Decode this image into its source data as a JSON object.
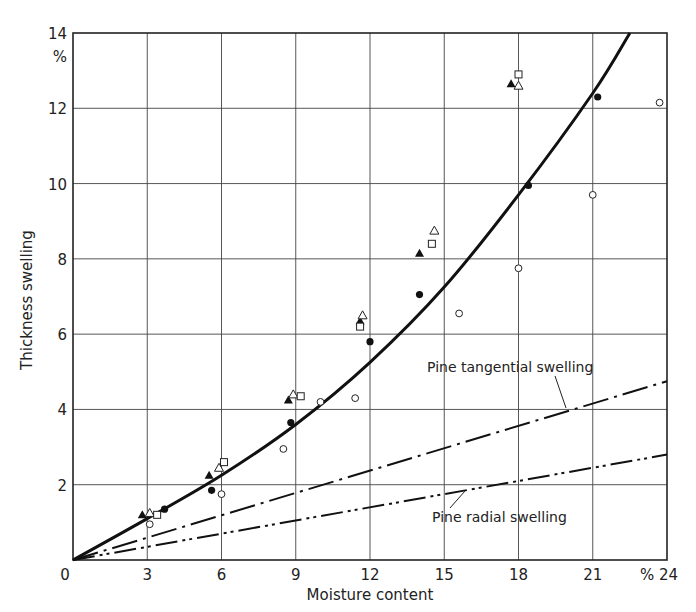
{
  "chart_data": {
    "type": "scatter",
    "title": "",
    "xlabel": "Moisture content",
    "ylabel": "Thickness swelling",
    "x_unit": "%",
    "y_unit": "%",
    "xlim": [
      0,
      24
    ],
    "ylim": [
      0,
      14
    ],
    "x_ticks": [
      "0",
      "3",
      "6",
      "9",
      "12",
      "15",
      "18",
      "21",
      "% 24"
    ],
    "y_ticks": [
      "2",
      "4",
      "6",
      "8",
      "10",
      "12",
      "14"
    ],
    "grid": true,
    "series": [
      {
        "name": "filled circles",
        "marker": "filled-circle",
        "points": [
          [
            3.7,
            1.35
          ],
          [
            5.6,
            1.85
          ],
          [
            8.8,
            3.65
          ],
          [
            12.0,
            5.8
          ],
          [
            14.0,
            7.05
          ],
          [
            18.4,
            9.95
          ],
          [
            21.2,
            12.3
          ]
        ]
      },
      {
        "name": "open circles",
        "marker": "open-circle",
        "points": [
          [
            3.1,
            0.95
          ],
          [
            6.0,
            1.75
          ],
          [
            8.5,
            2.95
          ],
          [
            10.0,
            4.2
          ],
          [
            11.4,
            4.3
          ],
          [
            15.6,
            6.55
          ],
          [
            18.0,
            7.75
          ],
          [
            21.0,
            9.7
          ],
          [
            23.7,
            12.15
          ]
        ]
      },
      {
        "name": "filled triangles",
        "marker": "filled-triangle",
        "points": [
          [
            2.8,
            1.2
          ],
          [
            5.5,
            2.25
          ],
          [
            8.7,
            4.25
          ],
          [
            11.6,
            6.35
          ],
          [
            14.0,
            8.15
          ],
          [
            17.7,
            12.65
          ]
        ]
      },
      {
        "name": "open triangles",
        "marker": "open-triangle",
        "points": [
          [
            3.1,
            1.25
          ],
          [
            5.9,
            2.45
          ],
          [
            8.9,
            4.4
          ],
          [
            11.7,
            6.5
          ],
          [
            14.6,
            8.75
          ],
          [
            18.0,
            12.6
          ]
        ]
      },
      {
        "name": "open squares",
        "marker": "open-square",
        "points": [
          [
            3.4,
            1.2
          ],
          [
            6.1,
            2.6
          ],
          [
            9.2,
            4.35
          ],
          [
            11.6,
            6.2
          ],
          [
            14.5,
            8.4
          ],
          [
            18.0,
            12.9
          ]
        ]
      },
      {
        "name": "fitted curve",
        "type": "line",
        "style": "solid-bold",
        "points": [
          [
            0,
            0
          ],
          [
            3,
            1.1
          ],
          [
            6,
            2.25
          ],
          [
            9,
            3.6
          ],
          [
            12,
            5.25
          ],
          [
            15,
            7.25
          ],
          [
            18,
            9.7
          ],
          [
            21,
            12.4
          ],
          [
            22.5,
            14.0
          ]
        ]
      },
      {
        "name": "Pine tangential swelling",
        "type": "line",
        "style": "dash-dot",
        "points": [
          [
            0,
            0
          ],
          [
            24,
            4.75
          ]
        ]
      },
      {
        "name": "Pine radial swelling",
        "type": "line",
        "style": "dash-dot-dot",
        "points": [
          [
            0,
            0
          ],
          [
            24,
            2.8
          ]
        ]
      }
    ],
    "annotations": [
      {
        "text": "Pine tangential swelling",
        "x": 15.8,
        "y": 5.6
      },
      {
        "text": "Pine radial swelling",
        "x": 14.2,
        "y": 1.0
      }
    ]
  }
}
